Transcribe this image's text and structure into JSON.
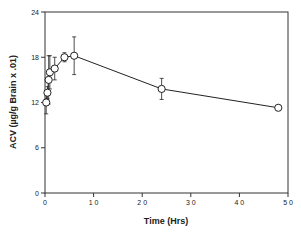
{
  "chart_data": {
    "type": "line",
    "title": "",
    "xlabel": "Time (Hrs)",
    "ylabel": "ACV (µg/g Brain x .01)",
    "xlim": [
      0,
      50
    ],
    "ylim": [
      0,
      24
    ],
    "xticks": [
      0,
      10,
      20,
      30,
      40,
      50
    ],
    "xtick_labels": [
      "0",
      "1 0",
      "2 0",
      "3 0",
      "4 0",
      "5 0"
    ],
    "yticks": [
      0,
      6,
      12,
      18,
      24
    ],
    "ytick_labels": [
      "0",
      "6",
      "12",
      "18",
      "24"
    ],
    "grid": false,
    "legend": "none",
    "series": [
      {
        "name": "ACV",
        "marker": "open-circle",
        "points": [
          {
            "x": 0.25,
            "y": 12.0,
            "err": 1.5
          },
          {
            "x": 0.5,
            "y": 13.3,
            "err": 0.8
          },
          {
            "x": 0.75,
            "y": 15.0,
            "err": 3.2
          },
          {
            "x": 1,
            "y": 16.0,
            "err": 2.2
          },
          {
            "x": 2,
            "y": 16.5,
            "err": 1.5
          },
          {
            "x": 4,
            "y": 18.0,
            "err": 0.6
          },
          {
            "x": 6,
            "y": 18.2,
            "err": 2.5
          },
          {
            "x": 24,
            "y": 13.8,
            "err": 1.4
          },
          {
            "x": 48,
            "y": 11.3,
            "err": 0.3
          }
        ]
      }
    ]
  }
}
